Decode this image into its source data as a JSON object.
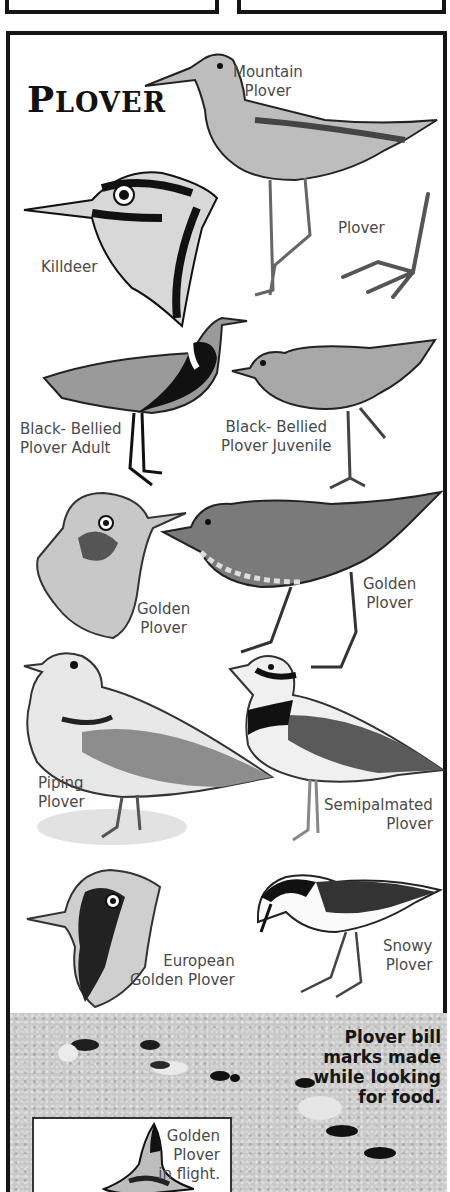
{
  "page": {
    "title_first_letter": "P",
    "title_rest": "LOVER",
    "top_boxes": [
      "left-panel",
      "right-panel"
    ]
  },
  "birds": [
    {
      "id": "mountain",
      "label_line1": "Mountain",
      "label_line2": "Plover"
    },
    {
      "id": "foot",
      "label_line1": "Plover",
      "label_line2": ""
    },
    {
      "id": "killdeer",
      "label_line1": "Killdeer",
      "label_line2": ""
    },
    {
      "id": "black-bellied-adult",
      "label_line1": "Black- Bellied",
      "label_line2": "Plover Adult"
    },
    {
      "id": "black-bellied-juvenile",
      "label_line1": "Black- Bellied",
      "label_line2": "Plover Juvenile"
    },
    {
      "id": "golden-head",
      "label_line1": "Golden",
      "label_line2": "Plover"
    },
    {
      "id": "golden-full",
      "label_line1": "Golden",
      "label_line2": "Plover"
    },
    {
      "id": "piping",
      "label_line1": "Piping",
      "label_line2": "Plover"
    },
    {
      "id": "semipalmated",
      "label_line1": "Semipalmated",
      "label_line2": "Plover"
    },
    {
      "id": "european-golden",
      "label_line1": "European",
      "label_line2": "Golden Plover"
    },
    {
      "id": "snowy",
      "label_line1": "Snowy",
      "label_line2": "Plover"
    }
  ],
  "sand": {
    "caption_lines": [
      "Plover bill",
      "marks made",
      "while looking",
      "for food."
    ]
  },
  "inset": {
    "caption_lines": [
      "Golden",
      "Plover",
      "in flight."
    ]
  },
  "colors": {
    "border": "#151515",
    "label_text": "#4a4a4a",
    "sand": "#c9c9c9",
    "background": "#ffffff"
  }
}
